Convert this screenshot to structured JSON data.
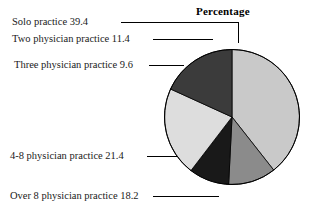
{
  "chart_data": {
    "type": "pie",
    "title": "Percentage",
    "xlabel": "",
    "ylabel": "",
    "units": "percent",
    "total": 100.0,
    "start_angle_deg": 0,
    "direction": "clockwise",
    "categories": [
      "Solo practice",
      "Two physician practice",
      "Three physician practice",
      "4-8 physician practice",
      "Over 8 physician practice"
    ],
    "values": [
      39.4,
      11.4,
      9.6,
      21.4,
      18.2
    ],
    "labels": [
      "Solo practice 39.4",
      "Two physician practice 11.4",
      "Three physician practice  9.6",
      "4-8 physician practice 21.4",
      "Over 8 physician practice 18.2"
    ],
    "slice_colors": [
      "#c9c9c9",
      "#8b8b8b",
      "#191919",
      "#dddddd",
      "#3b3b3b"
    ],
    "slices": [
      {
        "name": "Solo practice",
        "value": 39.4,
        "label": "Solo practice 39.4",
        "color": "#c9c9c9"
      },
      {
        "name": "Two physician practice",
        "value": 11.4,
        "label": "Two physician practice 11.4",
        "color": "#8b8b8b"
      },
      {
        "name": "Three physician practice",
        "value": 9.6,
        "label": "Three physician practice  9.6",
        "color": "#191919"
      },
      {
        "name": "4-8 physician practice",
        "value": 21.4,
        "label": "4-8 physician practice 21.4",
        "color": "#dddddd"
      },
      {
        "name": "Over 8 physician practice",
        "value": 18.2,
        "label": "Over 8 physician practice 18.2",
        "color": "#3b3b3b"
      }
    ],
    "legend": "none",
    "grid": false,
    "outline_color": "#000000",
    "background": "#ffffff"
  }
}
